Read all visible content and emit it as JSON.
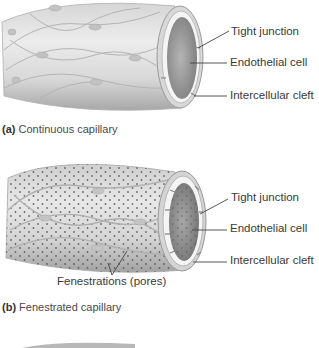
{
  "panel_a": {
    "caption_letter": "(a)",
    "caption_text": " Continuous capillary",
    "labels": {
      "tight_junction": "Tight junction",
      "endothelial_cell": "Endothelial cell",
      "intercellular_cleft": "Intercellular cleft"
    }
  },
  "panel_b": {
    "caption_letter": "(b)",
    "caption_text": " Fenestrated capillary",
    "labels": {
      "tight_junction": "Tight junction",
      "endothelial_cell": "Endothelial cell",
      "intercellular_cleft": "Intercellular cleft",
      "fenestrations": "Fenestrations (pores)"
    }
  },
  "colors": {
    "tube_light": "#e2e2e2",
    "tube_mid": "#c8c8c8",
    "tube_dark": "#9a9a9a",
    "lumen": "#8c8c8c",
    "pore": "#555555",
    "leader_line": "#444444"
  }
}
